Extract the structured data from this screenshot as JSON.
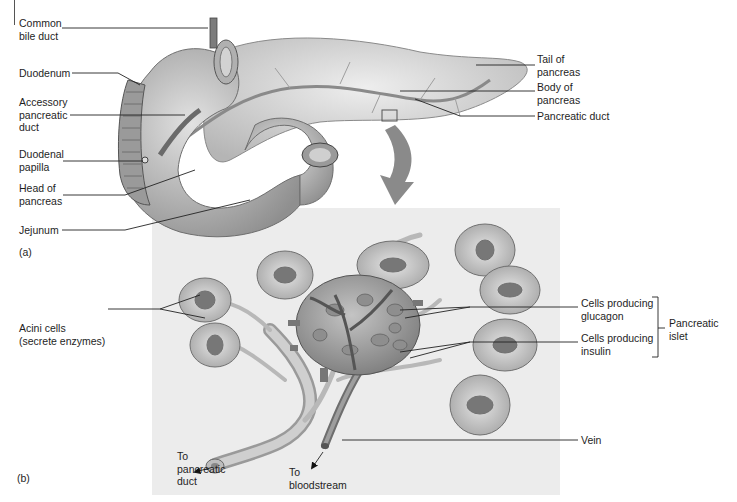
{
  "figure": {
    "panel_a": {
      "tag": "(a)",
      "labels": {
        "common_bile_duct": "Common\nbile duct",
        "duodenum": "Duodenum",
        "accessory_pancreatic_duct": "Accessory\npancreatic\nduct",
        "duodenal_papilla": "Duodenal\npapilla",
        "head_of_pancreas": "Head of\npancreas",
        "jejunum": "Jejunum",
        "tail_of_pancreas": "Tail of\npancreas",
        "body_of_pancreas": "Body of\npancreas",
        "pancreatic_duct": "Pancreatic duct"
      }
    },
    "panel_b": {
      "tag": "(b)",
      "labels": {
        "acini_cells": "Acini cells\n(secrete enzymes)",
        "cells_glucagon": "Cells producing\nglucagon",
        "cells_insulin": "Cells producing\ninsulin",
        "pancreatic_islet": "Pancreatic\nislet",
        "vein": "Vein",
        "to_pancreatic_duct": "To\npancreatic\nduct",
        "to_bloodstream": "To\nbloodstream"
      }
    },
    "colors": {
      "panel_bg": "#ececec",
      "tissue_light": "#d8d8d8",
      "tissue_mid": "#a8a8a8",
      "tissue_dark": "#6e6e6e",
      "leader_line": "#222222"
    }
  }
}
